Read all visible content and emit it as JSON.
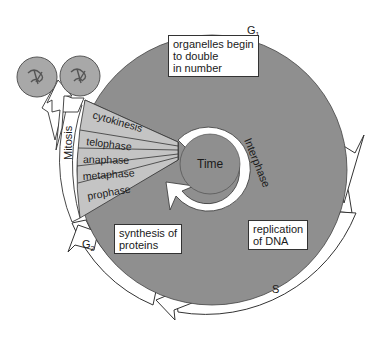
{
  "colors": {
    "disc_fill": "#8f8f8f",
    "wedge_fill": "#bdbdbd",
    "arrow_fill": "#ffffff",
    "outline": "#333333",
    "cell_fill": "#a8a8a8"
  },
  "phases": {
    "g1": "G",
    "g1_sub": "1",
    "g2": "G",
    "g2_sub": "2",
    "s": "S",
    "interphase": "Interphase",
    "mitosis": "Mitosis",
    "center": "Time"
  },
  "mitosis_stages": [
    "cytokinesis",
    "telophase",
    "anaphase",
    "metaphase",
    "prophase"
  ],
  "boxes": {
    "g1_note": "organelles begin\nto double\nin number",
    "g2_note": "synthesis of\nproteins",
    "s_note": "replication\nof DNA"
  },
  "daughter_cells": [
    "daughter-cell-1",
    "daughter-cell-2"
  ]
}
